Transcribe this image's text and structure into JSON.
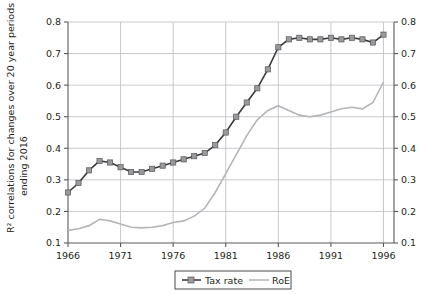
{
  "chart_data": {
    "type": "line",
    "title": "",
    "xlabel": "",
    "ylabel": "R² correlations for changes over 20 year periods ending 2016",
    "ylabel_line1": "R² correlations for changes over 20 year periods",
    "ylabel_line2": "ending 2016",
    "xlim": [
      1966,
      1997
    ],
    "ylim": [
      0.1,
      0.8
    ],
    "xticks": [
      1966,
      1971,
      1976,
      1981,
      1986,
      1991,
      1996
    ],
    "xtick_labels": [
      "1966",
      "1971",
      "1976",
      "1981",
      "1986",
      "1991",
      "1996"
    ],
    "yticks": [
      0.1,
      0.2,
      0.3,
      0.4,
      0.5,
      0.6,
      0.7,
      0.8
    ],
    "ytick_labels": [
      "0.1",
      "0.2",
      "0.3",
      "0.4",
      "0.5",
      "0.6",
      "0.7",
      "0.8"
    ],
    "right_axis_labels": [
      "0.1",
      "0.2",
      "0.3",
      "0.4",
      "0.5",
      "0.6",
      "0.7",
      "0.8"
    ],
    "grid": true,
    "legend_position": "bottom-center",
    "x": [
      1966,
      1967,
      1968,
      1969,
      1970,
      1971,
      1972,
      1973,
      1974,
      1975,
      1976,
      1977,
      1978,
      1979,
      1980,
      1981,
      1982,
      1983,
      1984,
      1985,
      1986,
      1987,
      1988,
      1989,
      1990,
      1991,
      1992,
      1993,
      1994,
      1995,
      1996
    ],
    "series": [
      {
        "name": "Tax rate",
        "color": "#3b3b3d",
        "marker": "square",
        "marker_color": "#9a9a9c",
        "values": [
          0.26,
          0.29,
          0.33,
          0.36,
          0.355,
          0.34,
          0.325,
          0.325,
          0.335,
          0.345,
          0.355,
          0.365,
          0.375,
          0.385,
          0.41,
          0.45,
          0.5,
          0.545,
          0.59,
          0.65,
          0.72,
          0.745,
          0.75,
          0.745,
          0.745,
          0.75,
          0.745,
          0.75,
          0.745,
          0.735,
          0.76
        ]
      },
      {
        "name": "RoE",
        "color": "#b4b5b8",
        "marker": "none",
        "values": [
          0.14,
          0.145,
          0.155,
          0.175,
          0.17,
          0.16,
          0.15,
          0.148,
          0.15,
          0.155,
          0.165,
          0.17,
          0.185,
          0.21,
          0.26,
          0.32,
          0.38,
          0.44,
          0.49,
          0.52,
          0.535,
          0.52,
          0.505,
          0.5,
          0.505,
          0.515,
          0.525,
          0.53,
          0.525,
          0.545,
          0.61
        ]
      }
    ],
    "legend": [
      {
        "label": "Tax rate",
        "color": "#3b3b3d",
        "marker": "square"
      },
      {
        "label": "RoE",
        "color": "#b4b5b8",
        "marker": "none"
      }
    ]
  }
}
